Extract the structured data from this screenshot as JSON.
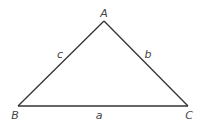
{
  "diagram": {
    "type": "triangle",
    "vertices": [
      {
        "name": "A",
        "x": 104,
        "y": 21,
        "label_x": 104,
        "label_y": 17
      },
      {
        "name": "B",
        "x": 18,
        "y": 106,
        "label_x": 15,
        "label_y": 119
      },
      {
        "name": "C",
        "x": 188,
        "y": 106,
        "label_x": 189,
        "label_y": 119
      }
    ],
    "sides": [
      {
        "name": "a",
        "from": "B",
        "to": "C",
        "label_x": 99,
        "label_y": 119
      },
      {
        "name": "b",
        "from": "A",
        "to": "C",
        "label_x": 148,
        "label_y": 58
      },
      {
        "name": "c",
        "from": "A",
        "to": "B",
        "label_x": 60,
        "label_y": 58
      }
    ],
    "colors": {
      "line": "#333333",
      "text": "#444444",
      "background": "#ffffff"
    }
  }
}
